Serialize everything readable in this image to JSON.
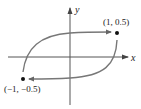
{
  "diagram": {
    "axes": {
      "x_label": "x",
      "y_label": "y"
    },
    "points": [
      {
        "label": "(1, 0.5)",
        "x": 1,
        "y": 0.5
      },
      {
        "label": "(−1, −0.5)",
        "x": -1,
        "y": -0.5
      }
    ],
    "curve_color": "#777777",
    "axis_color": "#555555"
  }
}
